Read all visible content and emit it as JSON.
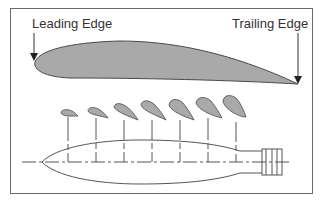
{
  "diagram": {
    "labels": {
      "leading_edge": "Leading Edge",
      "trailing_edge": "Trailing Edge"
    },
    "colors": {
      "airfoil_fill": "#a9a9a9",
      "outline": "#4a4a4a",
      "frame": "#6a6a6a",
      "text": "#333333"
    },
    "sections": [
      {
        "index": 1,
        "station_x": 68
      },
      {
        "index": 2,
        "station_x": 96
      },
      {
        "index": 3,
        "station_x": 124
      },
      {
        "index": 4,
        "station_x": 152
      },
      {
        "index": 5,
        "station_x": 180
      },
      {
        "index": 6,
        "station_x": 208
      },
      {
        "index": 7,
        "station_x": 236
      }
    ]
  }
}
